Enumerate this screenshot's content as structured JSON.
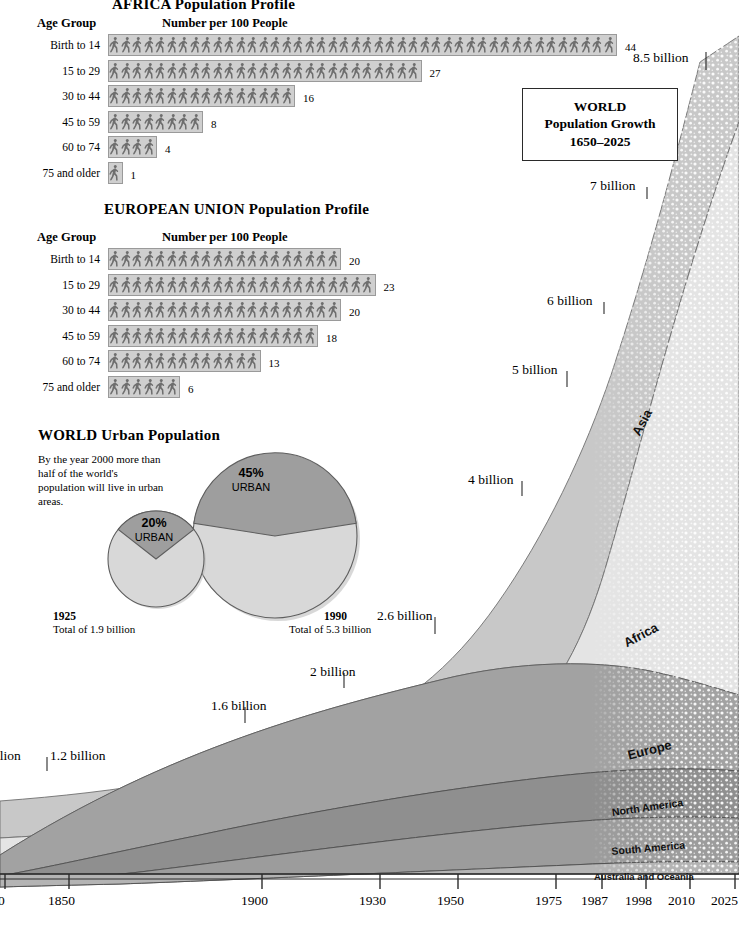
{
  "africa": {
    "title": "AFRICA  Population Profile",
    "age_header": "Age Group",
    "number_header": "Number per 100 People",
    "rows": [
      {
        "label": "Birth to 14",
        "value": 44
      },
      {
        "label": "15 to 29",
        "value": 27
      },
      {
        "label": "30 to 44",
        "value": 16
      },
      {
        "label": "45 to 59",
        "value": 8
      },
      {
        "label": "60 to 74",
        "value": 4
      },
      {
        "label": "75 and older",
        "value": 1
      }
    ]
  },
  "eu": {
    "title": "EUROPEAN UNION  Population Profile",
    "age_header": "Age Group",
    "number_header": "Number per 100 People",
    "rows": [
      {
        "label": "Birth to 14",
        "value": 20
      },
      {
        "label": "15 to 29",
        "value": 23
      },
      {
        "label": "30 to 44",
        "value": 20
      },
      {
        "label": "45 to 59",
        "value": 18
      },
      {
        "label": "60 to 74",
        "value": 13
      },
      {
        "label": "75 and older",
        "value": 6
      }
    ]
  },
  "urban": {
    "title": "WORLD  Urban Population",
    "blurb": "By the year 2000 more than half of the world's population will live in urban areas.",
    "pies": [
      {
        "year": "1925",
        "total": "Total of 1.9 billion",
        "urban_pct_label": "20%",
        "urban_word": "URBAN",
        "urban_fraction": 20
      },
      {
        "year": "1990",
        "total": "Total of 5.3 billion",
        "urban_pct_label": "45%",
        "urban_word": "URBAN",
        "urban_fraction": 45
      }
    ]
  },
  "growth": {
    "title_line1": "WORLD",
    "title_line2": "Population Growth",
    "title_line3": "1650–2025",
    "year_labels": [
      "0",
      "1850",
      "1900",
      "1930",
      "1950",
      "1975",
      "1987",
      "1998",
      "2010",
      "2025"
    ],
    "callouts": [
      {
        "text": "llion"
      },
      {
        "text": "1.2 billion"
      },
      {
        "text": "1.6 billion"
      },
      {
        "text": "2 billion"
      },
      {
        "text": "2.6  billion"
      },
      {
        "text": "4 billion"
      },
      {
        "text": "5 billion"
      },
      {
        "text": "6 billion"
      },
      {
        "text": "7 billion"
      },
      {
        "text": "8.5 billion"
      }
    ],
    "continents": [
      "Asia",
      "Africa",
      "Europe",
      "North America",
      "South America",
      "Australia and Oceania"
    ]
  },
  "colors": {
    "asia": "#c8c8c8",
    "africa": "#e4e4e4",
    "europe": "#a2a2a2",
    "north_america": "#8f8f8f",
    "south_america": "#9c9c9c",
    "australia": "#b4b4b4",
    "picto_bg": "#cfcfcf",
    "picto_fig": "#6e6e6e",
    "pie_urban": "#9e9e9e",
    "pie_rural": "#d8d8d8"
  },
  "chart_data": {
    "type": "area",
    "title": "WORLD Population Growth 1650–2025",
    "xlabel": "",
    "ylabel": "Population (billions)",
    "x": [
      1650,
      1850,
      1900,
      1930,
      1950,
      1975,
      1987,
      1998,
      2010,
      2025
    ],
    "total_values": [
      0.5,
      1.2,
      1.6,
      2.0,
      2.6,
      4.0,
      5.0,
      6.0,
      7.0,
      8.5
    ],
    "annotations": [
      "1 billion",
      "1.2 billion",
      "1.6 billion",
      "2 billion",
      "2.6 billion",
      "4 billion",
      "5 billion",
      "6 billion",
      "7 billion",
      "8.5 billion"
    ],
    "projection_start": 1998,
    "series": [
      {
        "name": "Asia",
        "values": [
          0.26,
          0.66,
          0.88,
          1.1,
          1.4,
          2.3,
          2.92,
          3.55,
          4.18,
          5.18
        ]
      },
      {
        "name": "Africa",
        "values": [
          0.07,
          0.1,
          0.13,
          0.17,
          0.23,
          0.41,
          0.6,
          0.79,
          1.03,
          1.5
        ]
      },
      {
        "name": "Europe",
        "values": [
          0.1,
          0.27,
          0.4,
          0.48,
          0.57,
          0.68,
          0.7,
          0.72,
          0.72,
          0.7
        ]
      },
      {
        "name": "North America",
        "values": [
          0.02,
          0.08,
          0.11,
          0.15,
          0.19,
          0.27,
          0.3,
          0.33,
          0.37,
          0.42
        ]
      },
      {
        "name": "South America",
        "values": [
          0.03,
          0.07,
          0.07,
          0.09,
          0.15,
          0.28,
          0.35,
          0.44,
          0.53,
          0.64
        ]
      },
      {
        "name": "Australia and Oceania",
        "values": [
          0.02,
          0.02,
          0.01,
          0.01,
          0.06,
          0.06,
          0.13,
          0.17,
          0.17,
          0.06
        ]
      }
    ],
    "ylim": [
      0,
      9
    ],
    "grid": false,
    "legend": "inline-labels"
  }
}
